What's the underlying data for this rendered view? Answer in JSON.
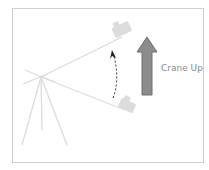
{
  "diagram": {
    "label": "Crane Up",
    "colors": {
      "arrow_fill": "#8c8c8c",
      "arrow_stroke": "#6e6e6e",
      "rig": "#dcdcdc",
      "frame_border": "#d0d0d0",
      "dashed_path": "#222222"
    }
  }
}
